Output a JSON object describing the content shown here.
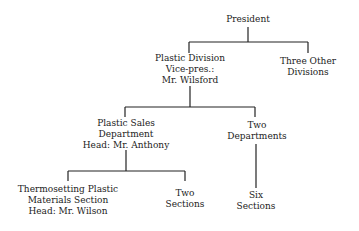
{
  "org_chart": {
    "president": {
      "lines": [
        "President"
      ]
    },
    "plastic_division": {
      "lines": [
        "Plastic Division",
        "Vice-pres.:",
        "Mr. Wilsford"
      ]
    },
    "three_other_divisions": {
      "lines": [
        "Three Other",
        "Divisions"
      ]
    },
    "plastic_sales_department": {
      "lines": [
        "Plastic Sales",
        "Department",
        "Head: Mr. Anthony"
      ]
    },
    "two_departments": {
      "lines": [
        "Two",
        "Departments"
      ]
    },
    "thermosetting_section": {
      "lines": [
        "Thermosetting Plastic",
        "Materials Section",
        "Head: Mr. Wilson"
      ]
    },
    "two_sections": {
      "lines": [
        "Two",
        "Sections"
      ]
    },
    "six_sections": {
      "lines": [
        "Six",
        "Sections"
      ]
    }
  }
}
